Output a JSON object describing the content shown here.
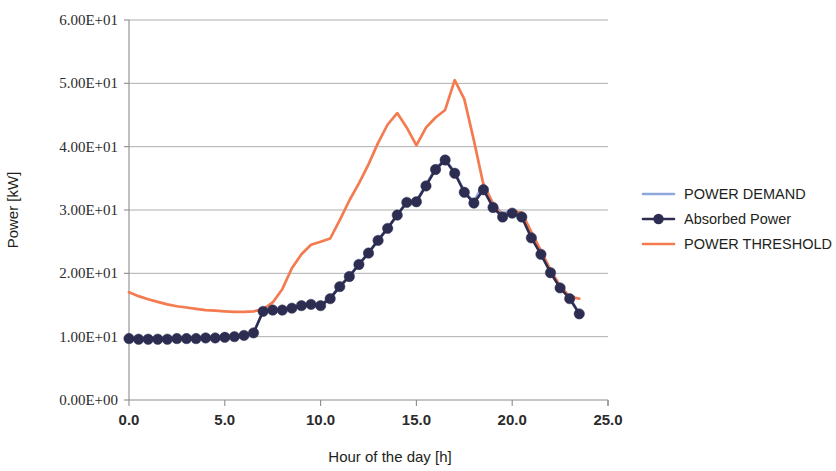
{
  "chart_data": {
    "type": "line",
    "title": "",
    "xlabel": "Hour of the day [h]",
    "ylabel": "Power [kW]",
    "xlim": [
      0,
      25
    ],
    "ylim": [
      0,
      60
    ],
    "xticks": [
      0,
      5,
      10,
      15,
      20,
      25
    ],
    "xtick_labels": [
      "0.0",
      "5.0",
      "10.0",
      "15.0",
      "20.0",
      "25.0"
    ],
    "yticks": [
      0,
      10,
      20,
      30,
      40,
      50,
      60
    ],
    "ytick_labels": [
      "0.00E+00",
      "1.00E+01",
      "2.00E+01",
      "3.00E+01",
      "4.00E+01",
      "5.00E+01",
      "6.00E+01"
    ],
    "grid": "horizontal",
    "legend_position": "right",
    "series": [
      {
        "name": "POWER DEMAND",
        "color": "#8fa8dc",
        "marker": "none",
        "x": [
          0.0,
          0.5,
          1.0,
          1.5,
          2.0,
          2.5,
          3.0,
          3.5,
          4.0,
          4.5,
          5.0,
          5.5,
          6.0,
          6.5,
          7.0,
          7.5,
          8.0,
          8.5,
          9.0,
          9.5,
          10.0,
          10.5,
          11.0,
          11.5,
          12.0,
          12.5,
          13.0,
          13.5,
          14.0,
          14.5,
          15.0,
          15.5,
          16.0,
          16.5,
          17.0,
          17.5,
          18.0,
          18.5,
          19.0,
          19.5,
          20.0,
          20.5,
          21.0,
          21.5,
          22.0,
          22.5,
          23.0,
          23.5
        ],
        "values": [
          9.7,
          9.6,
          9.6,
          9.6,
          9.6,
          9.7,
          9.7,
          9.7,
          9.8,
          9.8,
          9.9,
          10.0,
          10.2,
          10.6,
          14.1,
          14.3,
          14.3,
          14.6,
          15.0,
          15.2,
          15.0,
          16.2,
          18.0,
          19.6,
          21.5,
          23.3,
          25.3,
          27.2,
          29.3,
          31.3,
          31.5,
          34.0,
          36.6,
          38.0,
          36.0,
          33.0,
          31.3,
          34.2,
          31.0,
          29.4,
          30.0,
          29.4,
          26.0,
          23.4,
          20.4,
          18.0,
          16.2,
          13.7
        ]
      },
      {
        "name": "Absorbed Power",
        "color": "#2d2d52",
        "marker": "circle",
        "x": [
          0.0,
          0.5,
          1.0,
          1.5,
          2.0,
          2.5,
          3.0,
          3.5,
          4.0,
          4.5,
          5.0,
          5.5,
          6.0,
          6.5,
          7.0,
          7.5,
          8.0,
          8.5,
          9.0,
          9.5,
          10.0,
          10.5,
          11.0,
          11.5,
          12.0,
          12.5,
          13.0,
          13.5,
          14.0,
          14.5,
          15.0,
          15.5,
          16.0,
          16.5,
          17.0,
          17.5,
          18.0,
          18.5,
          19.0,
          19.5,
          20.0,
          20.5,
          21.0,
          21.5,
          22.0,
          22.5,
          23.0,
          23.5
        ],
        "values": [
          9.7,
          9.6,
          9.6,
          9.6,
          9.6,
          9.7,
          9.7,
          9.7,
          9.8,
          9.8,
          9.9,
          10.0,
          10.2,
          10.6,
          14.0,
          14.2,
          14.2,
          14.5,
          14.9,
          15.1,
          14.9,
          16.0,
          17.9,
          19.5,
          21.4,
          23.2,
          25.2,
          27.1,
          29.2,
          31.2,
          31.3,
          33.8,
          36.4,
          37.9,
          35.8,
          32.8,
          31.1,
          33.2,
          30.4,
          28.9,
          29.5,
          28.9,
          25.6,
          23.0,
          20.1,
          17.7,
          16.0,
          13.6
        ]
      },
      {
        "name": "POWER THRESHOLD",
        "color": "#f47b50",
        "marker": "none",
        "x": [
          0.0,
          0.5,
          1.0,
          1.5,
          2.0,
          2.5,
          3.0,
          3.5,
          4.0,
          4.5,
          5.0,
          5.5,
          6.0,
          6.5,
          7.0,
          7.5,
          8.0,
          8.5,
          9.0,
          9.5,
          10.0,
          10.5,
          11.0,
          11.5,
          12.0,
          12.5,
          13.0,
          13.5,
          14.0,
          14.5,
          15.0,
          15.5,
          16.0,
          16.5,
          17.0,
          17.5,
          18.0,
          18.5,
          19.0,
          19.5,
          20.0,
          20.5,
          21.0,
          21.5,
          22.0,
          22.5,
          23.0,
          23.5
        ],
        "values": [
          17.0,
          16.4,
          15.9,
          15.5,
          15.1,
          14.8,
          14.6,
          14.4,
          14.2,
          14.1,
          14.0,
          13.9,
          13.9,
          14.0,
          14.3,
          15.4,
          17.5,
          20.8,
          23.0,
          24.5,
          25.0,
          25.5,
          28.4,
          31.5,
          34.2,
          37.2,
          40.6,
          43.5,
          45.3,
          43.0,
          40.2,
          43.0,
          44.6,
          45.8,
          50.5,
          47.5,
          41.0,
          34.0,
          31.0,
          29.0,
          29.8,
          29.6,
          26.5,
          23.6,
          20.5,
          18.0,
          16.3,
          16.0
        ]
      }
    ]
  },
  "legend": {
    "items": [
      {
        "label": "POWER DEMAND"
      },
      {
        "label": "Absorbed Power"
      },
      {
        "label": "POWER THRESHOLD"
      }
    ]
  }
}
